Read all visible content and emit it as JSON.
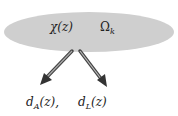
{
  "diagram": {
    "ellipse": {
      "fill": "#cfcfcf",
      "labels": [
        {
          "text": "χ(z)",
          "x": 50,
          "y": 22
        },
        {
          "main": "Ω",
          "sub": "k",
          "x": 100,
          "y": 22
        }
      ]
    },
    "arrows": [
      {
        "name": "arrow-to-dA",
        "from": [
          72,
          51
        ],
        "to": [
          42,
          83
        ]
      },
      {
        "name": "arrow-to-dL",
        "from": [
          80,
          51
        ],
        "to": [
          106,
          85
        ]
      }
    ],
    "outputs": [
      {
        "main": "d",
        "sub": "A",
        "rest": "(z),",
        "x": 26,
        "y": 97
      },
      {
        "main": "d",
        "sub": "L",
        "rest": "(z)",
        "x": 78,
        "y": 97
      }
    ]
  }
}
